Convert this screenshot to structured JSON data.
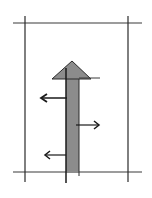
{
  "diagram": {
    "colors": {
      "line": "#2a2a2a",
      "arrow_fill": "#8c8c8c",
      "background": "#ffffff"
    },
    "main_arrow": {
      "direction": "up"
    },
    "branch_arrows": [
      {
        "direction": "left",
        "side": "left"
      },
      {
        "direction": "right",
        "side": "right"
      },
      {
        "direction": "left",
        "side": "left"
      }
    ]
  }
}
